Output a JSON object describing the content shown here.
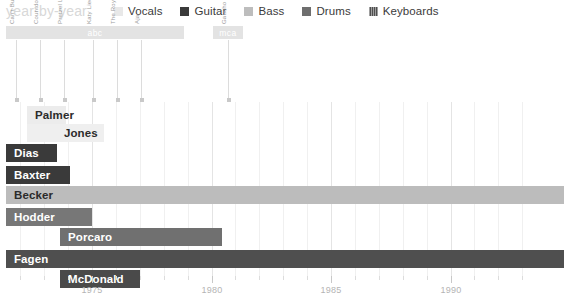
{
  "header": {
    "title": "year-by-year",
    "legend": [
      {
        "label": "Vocals",
        "color": "#e8e8e8",
        "striped": false
      },
      {
        "label": "Guitar",
        "color": "#3a3a3a",
        "striped": false
      },
      {
        "label": "Bass",
        "color": "#bdbdbd",
        "striped": false
      },
      {
        "label": "Drums",
        "color": "#6e6e6e",
        "striped": false
      },
      {
        "label": "Keyboards",
        "color": "#4f4f4f",
        "striped": true
      }
    ]
  },
  "axis": {
    "x_start_year": 1972,
    "x_end_year": 1993,
    "px_per_year": 23.9,
    "x_origin_px": 92,
    "origin_year": 1975,
    "major_labels": [
      "1975",
      "1980",
      "1985",
      "1990"
    ],
    "major_years": [
      1975,
      1980,
      1985,
      1990
    ],
    "minor_years": [
      1972,
      1973,
      1974,
      1976,
      1977,
      1978,
      1979,
      1981,
      1982,
      1983,
      1984,
      1986,
      1987,
      1988,
      1989,
      1991,
      1992,
      1993
    ]
  },
  "record_labels": [
    {
      "name": "abc",
      "start_px": 6,
      "width_px": 178
    },
    {
      "name": "mca",
      "start_px": 213,
      "width_px": 30
    }
  ],
  "albums": [
    {
      "title": "Can't Buy a Thrill",
      "x_px": 16
    },
    {
      "title": "Countdown to Ecstasy",
      "x_px": 40
    },
    {
      "title": "Pretzel Logic",
      "x_px": 64
    },
    {
      "title": "Katy Lied",
      "x_px": 93
    },
    {
      "title": "The Royal Scam",
      "x_px": 117
    },
    {
      "title": "Aja",
      "x_px": 141
    },
    {
      "title": "Gaucho",
      "x_px": 228
    }
  ],
  "chart_data": {
    "type": "bar",
    "title": "year-by-year",
    "xlabel": "",
    "ylabel": "",
    "xlim": [
      1972,
      1993
    ],
    "grid": true,
    "legend_position": "top",
    "categories": [
      "Palmer",
      "Jones",
      "Dias",
      "Baxter",
      "Becker",
      "Hodder",
      "Porcaro",
      "Fagen",
      "McDonald"
    ],
    "rows": [
      {
        "name": "Palmer",
        "role": "Vocals",
        "color": "#ececec",
        "striped": false,
        "start_px": 27,
        "end_px": 66,
        "row_top_px": 4,
        "label_align": "left",
        "label_color": "#2b2b2b",
        "start_year": 1972.4,
        "end_year": 1974.0
      },
      {
        "name": "Jones",
        "role": "Vocals",
        "color": "#efefef",
        "striped": false,
        "start_px": 27,
        "end_px": 104,
        "row_top_px": 22,
        "label_align": "right",
        "label_color": "#2b2b2b",
        "start_year": 1972.4,
        "end_year": 1975.5
      },
      {
        "name": "Dias",
        "role": "Guitar",
        "color": "#3a3a3a",
        "striped": false,
        "start_px": 6,
        "end_px": 57,
        "row_top_px": 42,
        "label_align": "left",
        "label_color": "#ffffff",
        "start_year": 1971.4,
        "end_year": 1973.6
      },
      {
        "name": "Baxter",
        "role": "Guitar",
        "color": "#3a3a3a",
        "striped": false,
        "start_px": 6,
        "end_px": 70,
        "row_top_px": 64,
        "label_align": "left",
        "label_color": "#ffffff",
        "start_year": 1971.4,
        "end_year": 1974.1
      },
      {
        "name": "Becker",
        "role": "Bass",
        "color": "#bcbcbc",
        "striped": false,
        "start_px": 6,
        "end_px": 564,
        "row_top_px": 84,
        "label_align": "left",
        "label_color": "#2b2b2b",
        "start_year": 1971.4,
        "end_year": 1993.7
      },
      {
        "name": "Hodder",
        "role": "Drums",
        "color": "#777777",
        "striped": false,
        "start_px": 6,
        "end_px": 92,
        "row_top_px": 106,
        "label_align": "left",
        "label_color": "#ffffff",
        "start_year": 1971.4,
        "end_year": 1975.0
      },
      {
        "name": "Porcaro",
        "role": "Drums",
        "color": "#707070",
        "striped": false,
        "start_px": 60,
        "end_px": 222,
        "row_top_px": 126,
        "label_align": "left",
        "label_color": "#ffffff",
        "start_year": 1973.8,
        "end_year": 1980.4
      },
      {
        "name": "Fagen",
        "role": "Keyboards",
        "color": "#4f4f4f",
        "striped": true,
        "start_px": 6,
        "end_px": 564,
        "row_top_px": 148,
        "label_align": "left",
        "label_color": "#ffffff",
        "start_year": 1971.4,
        "end_year": 1993.7
      },
      {
        "name": "McDonald",
        "role": "Keyboards",
        "color": "#4a4a4a",
        "striped": true,
        "start_px": 60,
        "end_px": 140,
        "row_top_px": 168,
        "label_align": "left",
        "label_color": "#ffffff",
        "start_year": 1973.8,
        "end_year": 1977.0
      }
    ]
  }
}
